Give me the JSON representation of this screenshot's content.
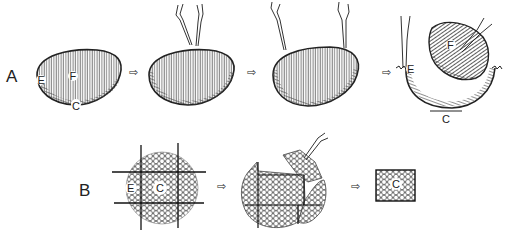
{
  "diagram": {
    "rows": [
      {
        "label": "A",
        "steps": [
          {
            "labels": [
              "E",
              "F",
              "C"
            ]
          },
          {
            "labels": []
          },
          {
            "labels": []
          },
          {
            "labels": [
              "F",
              "E",
              "C"
            ]
          }
        ]
      },
      {
        "label": "B",
        "steps": [
          {
            "labels": [
              "E",
              "C"
            ]
          },
          {
            "labels": []
          },
          {
            "labels": [
              "C"
            ]
          }
        ]
      }
    ],
    "arrow_symbol": "⇨",
    "colors": {
      "ink": "#222222",
      "background": "#ffffff"
    }
  }
}
